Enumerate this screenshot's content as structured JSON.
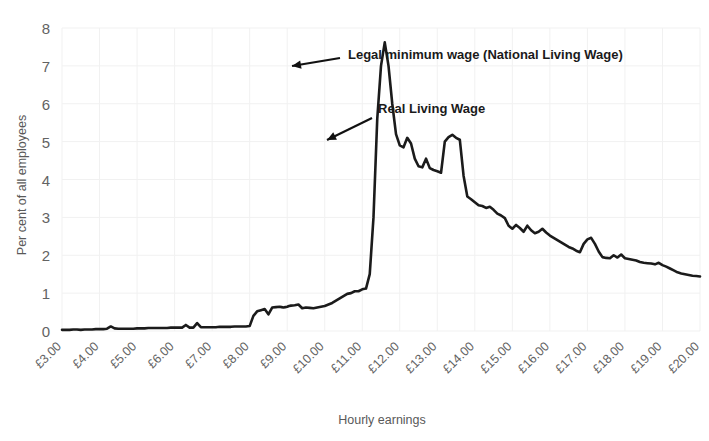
{
  "chart_data": {
    "type": "line",
    "title": "",
    "xlabel": "Hourly earnings",
    "ylabel": "Per cent of all employees",
    "xlim": [
      3.0,
      20.0
    ],
    "ylim": [
      0,
      8
    ],
    "grid": true,
    "legend_position": "none",
    "x_tick_labels": [
      "£3.00",
      "£4.00",
      "£5.00",
      "£6.00",
      "£7.00",
      "£8.00",
      "£9.00",
      "£10.00",
      "£11.00",
      "£12.00",
      "£13.00",
      "£14.00",
      "£15.00",
      "£16.00",
      "£17.00",
      "£18.00",
      "£19.00",
      "£20.00"
    ],
    "x_tick_values": [
      3,
      4,
      5,
      6,
      7,
      8,
      9,
      10,
      11,
      12,
      13,
      14,
      15,
      16,
      17,
      18,
      19,
      20
    ],
    "y_tick_labels": [
      "0",
      "1",
      "2",
      "3",
      "4",
      "5",
      "6",
      "7",
      "8"
    ],
    "y_tick_values": [
      0,
      1,
      2,
      3,
      4,
      5,
      6,
      7,
      8
    ],
    "series_name": "Distribution of employees by hourly earnings",
    "line_color": "#1b1b1b",
    "grid_color": "#f1f1f1",
    "axis_text_color": "#636363",
    "x": [
      3.0,
      3.1,
      3.2,
      3.3,
      3.4,
      3.5,
      3.6,
      3.7,
      3.8,
      3.9,
      4.0,
      4.1,
      4.2,
      4.3,
      4.4,
      4.5,
      4.6,
      4.7,
      4.8,
      4.9,
      5.0,
      5.1,
      5.2,
      5.3,
      5.4,
      5.5,
      5.6,
      5.7,
      5.8,
      5.9,
      6.0,
      6.1,
      6.2,
      6.3,
      6.4,
      6.5,
      6.6,
      6.7,
      6.8,
      6.9,
      7.0,
      7.1,
      7.2,
      7.3,
      7.4,
      7.5,
      7.6,
      7.7,
      7.8,
      7.9,
      8.0,
      8.1,
      8.2,
      8.3,
      8.4,
      8.5,
      8.6,
      8.7,
      8.8,
      8.85,
      8.9,
      8.95,
      9.0,
      9.05,
      9.1,
      9.2,
      9.3,
      9.4,
      9.5,
      9.6,
      9.7,
      9.8,
      9.9,
      10.0,
      10.1,
      10.2,
      10.3,
      10.4,
      10.5,
      10.6,
      10.7,
      10.8,
      10.9,
      11.0,
      11.1,
      11.2,
      11.3,
      11.4,
      11.5,
      11.6,
      11.7,
      11.8,
      11.9,
      12.0,
      12.1,
      12.2,
      12.3,
      12.4,
      12.5,
      12.6,
      12.7,
      12.8,
      12.9,
      13.0,
      13.1,
      13.2,
      13.3,
      13.4,
      13.5,
      13.6,
      13.7,
      13.8,
      13.9,
      14.0,
      14.1,
      14.2,
      14.3,
      14.4,
      14.5,
      14.6,
      14.7,
      14.8,
      14.9,
      15.0,
      15.1,
      15.2,
      15.3,
      15.4,
      15.5,
      15.6,
      15.7,
      15.8,
      15.9,
      16.0,
      16.1,
      16.2,
      16.3,
      16.4,
      16.5,
      16.6,
      16.7,
      16.8,
      16.9,
      17.0,
      17.1,
      17.2,
      17.3,
      17.4,
      17.5,
      17.6,
      17.7,
      17.8,
      17.9,
      18.0,
      18.1,
      18.2,
      18.3,
      18.4,
      18.5,
      18.6,
      18.7,
      18.8,
      18.9,
      19.0,
      19.1,
      19.2,
      19.3,
      19.4,
      19.5,
      19.6,
      19.7,
      19.8,
      19.9,
      20.0
    ],
    "values": [
      0.03,
      0.03,
      0.03,
      0.04,
      0.04,
      0.03,
      0.04,
      0.04,
      0.04,
      0.05,
      0.05,
      0.05,
      0.06,
      0.12,
      0.07,
      0.06,
      0.06,
      0.06,
      0.06,
      0.06,
      0.07,
      0.07,
      0.07,
      0.08,
      0.08,
      0.08,
      0.08,
      0.08,
      0.08,
      0.09,
      0.09,
      0.09,
      0.09,
      0.16,
      0.09,
      0.09,
      0.21,
      0.1,
      0.1,
      0.1,
      0.1,
      0.1,
      0.11,
      0.11,
      0.11,
      0.11,
      0.12,
      0.12,
      0.12,
      0.12,
      0.13,
      0.4,
      0.52,
      0.55,
      0.58,
      0.44,
      0.62,
      0.63,
      0.64,
      0.63,
      0.62,
      0.63,
      0.64,
      0.66,
      0.67,
      0.68,
      0.7,
      0.6,
      0.62,
      0.61,
      0.6,
      0.62,
      0.64,
      0.66,
      0.7,
      0.74,
      0.8,
      0.86,
      0.92,
      0.98,
      1.0,
      1.05,
      1.05,
      1.1,
      1.12,
      1.5,
      3.0,
      5.6,
      7.0,
      7.62,
      7.0,
      6.0,
      5.2,
      4.9,
      4.85,
      5.1,
      4.95,
      4.55,
      4.35,
      4.32,
      4.55,
      4.3,
      4.25,
      4.22,
      4.18,
      5.0,
      5.12,
      5.18,
      5.1,
      5.05,
      4.1,
      3.55,
      3.48,
      3.4,
      3.32,
      3.3,
      3.25,
      3.28,
      3.2,
      3.1,
      3.05,
      2.98,
      2.78,
      2.7,
      2.8,
      2.72,
      2.62,
      2.78,
      2.66,
      2.58,
      2.62,
      2.7,
      2.6,
      2.52,
      2.46,
      2.4,
      2.34,
      2.28,
      2.22,
      2.18,
      2.12,
      2.08,
      2.3,
      2.42,
      2.46,
      2.3,
      2.1,
      1.95,
      1.93,
      1.92,
      2.0,
      1.94,
      2.02,
      1.92,
      1.9,
      1.88,
      1.86,
      1.82,
      1.8,
      1.79,
      1.78,
      1.76,
      1.8,
      1.74,
      1.7,
      1.65,
      1.6,
      1.55,
      1.52,
      1.5,
      1.48,
      1.46,
      1.45,
      1.44
    ]
  },
  "annotations": [
    {
      "id": "legal-minimum-wage",
      "text": "Legal minimum wage (National Living Wage)",
      "label_x": 348,
      "label_y": 59,
      "arrow_from_x": 340,
      "arrow_from_y": 58,
      "arrow_to_x": 292,
      "arrow_to_y": 66
    },
    {
      "id": "real-living-wage",
      "text": "Real Living Wage",
      "label_x": 378,
      "label_y": 113,
      "arrow_from_x": 372,
      "arrow_from_y": 118,
      "arrow_to_x": 327,
      "arrow_to_y": 140
    }
  ]
}
